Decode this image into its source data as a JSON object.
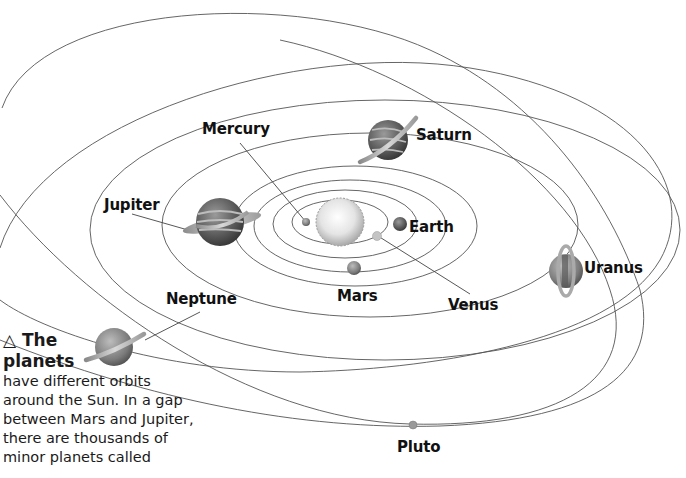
{
  "diagram": {
    "type": "solar-system-orbits",
    "center": "Sun",
    "planets": [
      {
        "name": "Mercury",
        "label": "Mercury"
      },
      {
        "name": "Venus",
        "label": "Venus"
      },
      {
        "name": "Earth",
        "label": "Earth"
      },
      {
        "name": "Mars",
        "label": "Mars"
      },
      {
        "name": "Jupiter",
        "label": "Jupiter"
      },
      {
        "name": "Saturn",
        "label": "Saturn"
      },
      {
        "name": "Uranus",
        "label": "Uranus"
      },
      {
        "name": "Neptune",
        "label": "Neptune"
      },
      {
        "name": "Pluto",
        "label": "Pluto"
      }
    ]
  },
  "labels": {
    "mercury": "Mercury",
    "venus": "Venus",
    "earth": "Earth",
    "mars": "Mars",
    "jupiter": "Jupiter",
    "saturn": "Saturn",
    "uranus": "Uranus",
    "neptune": "Neptune",
    "pluto": "Pluto"
  },
  "caption": {
    "marker": "△",
    "title_line1": "The",
    "title_line2": "planets",
    "body_lines": [
      "have different orbits",
      "around the Sun. In a gap",
      "between Mars and Jupiter,",
      "there are thousands of",
      "minor planets called"
    ]
  },
  "colors": {
    "orbit": "#555555",
    "text": "#111111",
    "background": "#ffffff"
  }
}
